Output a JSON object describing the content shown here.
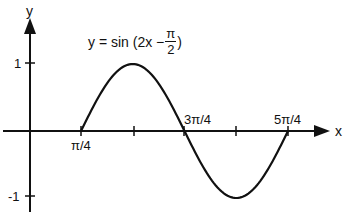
{
  "chart_data": {
    "type": "line",
    "title_parts": {
      "prefix": "y = sin (2x −",
      "frac_num": "π",
      "frac_den": "2",
      "suffix": ")"
    },
    "xlabel": "x",
    "ylabel": "y",
    "x_ticks": [
      {
        "value": 0.7854,
        "label": "π/4"
      },
      {
        "value": 1.5708,
        "label": ""
      },
      {
        "value": 2.3562,
        "label": "3π/4"
      },
      {
        "value": 3.1416,
        "label": ""
      },
      {
        "value": 3.927,
        "label": "5π/4"
      }
    ],
    "y_ticks": [
      {
        "value": 1,
        "label": "1"
      },
      {
        "value": -1,
        "label": "-1"
      }
    ],
    "series": [
      {
        "name": "y = sin(2x − π/2)",
        "x_start": 0.7854,
        "x_end": 3.927,
        "points": [
          [
            0.7854,
            0
          ],
          [
            1.5708,
            1
          ],
          [
            2.3562,
            0
          ],
          [
            3.1416,
            -1
          ],
          [
            3.927,
            0
          ]
        ]
      }
    ],
    "ylim": [
      -1.3,
      1.5
    ],
    "grid": false,
    "legend": "none"
  },
  "labels": {
    "y_axis": "y",
    "x_axis": "x",
    "tick_pi4": "π/4",
    "tick_3pi4": "3π/4",
    "tick_5pi4": "5π/4",
    "tick_1": "1",
    "tick_m1": "-1"
  }
}
